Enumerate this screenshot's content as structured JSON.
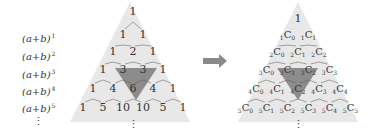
{
  "left_labels": [
    {
      "base": "(a+b)",
      "exp": "1"
    },
    {
      "base": "(a+b)",
      "exp": "2"
    },
    {
      "base": "(a+b)",
      "exp": "3"
    },
    {
      "base": "(a+b)",
      "exp": "4"
    },
    {
      "base": "(a+b)",
      "exp": "5"
    }
  ],
  "ellipsis": "⋮",
  "pascal_rows": [
    [
      "1"
    ],
    [
      "1",
      "1"
    ],
    [
      "1",
      "2",
      "1"
    ],
    [
      "1",
      "3",
      "3",
      "1"
    ],
    [
      "1",
      "4",
      "6",
      "4",
      "1"
    ],
    [
      "1",
      "5",
      "10",
      "10",
      "5",
      "1"
    ]
  ],
  "combo_top": "1",
  "combo_rows": [
    [
      {
        "n": "1",
        "k": "0"
      },
      {
        "n": "1",
        "k": "1"
      }
    ],
    [
      {
        "n": "2",
        "k": "0"
      },
      {
        "n": "2",
        "k": "1"
      },
      {
        "n": "2",
        "k": "2"
      }
    ],
    [
      {
        "n": "3",
        "k": "0"
      },
      {
        "n": "3",
        "k": "1"
      },
      {
        "n": "3",
        "k": "2"
      },
      {
        "n": "3",
        "k": "3"
      }
    ],
    [
      {
        "n": "4",
        "k": "0"
      },
      {
        "n": "4",
        "k": "1"
      },
      {
        "n": "4",
        "k": "2"
      },
      {
        "n": "4",
        "k": "3"
      },
      {
        "n": "4",
        "k": "4"
      }
    ],
    [
      {
        "n": "5",
        "k": "0"
      },
      {
        "n": "5",
        "k": "1"
      },
      {
        "n": "5",
        "k": "2"
      },
      {
        "n": "5",
        "k": "3"
      },
      {
        "n": "5",
        "k": "4"
      },
      {
        "n": "5",
        "k": "5"
      }
    ]
  ],
  "combo_letter": "C",
  "colors": {
    "triangle_bg": "#e8e8e8",
    "highlight": "#8c8c8c",
    "arrow": "#8a8a8a",
    "text": "#333333"
  }
}
